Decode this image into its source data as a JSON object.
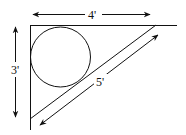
{
  "diagram": {
    "labels": {
      "top": "4'",
      "left": "3'",
      "hypotenuse": "5'"
    },
    "colors": {
      "stroke": "#111111",
      "background": "#ffffff"
    }
  }
}
